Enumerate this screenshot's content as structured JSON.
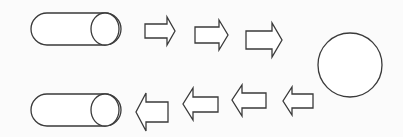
{
  "diagram": {
    "type": "flow-cycle",
    "colors": {
      "background": "#fbfbfb",
      "stroke": "#3a3a3a",
      "fill": "#ffffff"
    },
    "nodes": [
      {
        "id": "top-cylinder",
        "shape": "horizontal-cylinder",
        "text": ""
      },
      {
        "id": "circle",
        "shape": "circle",
        "text": ""
      },
      {
        "id": "bottom-cylinder",
        "shape": "horizontal-cylinder",
        "text": ""
      }
    ],
    "top_arrows": {
      "direction": "right",
      "count": 3
    },
    "bottom_arrows": {
      "direction": "left",
      "count": 4
    }
  }
}
